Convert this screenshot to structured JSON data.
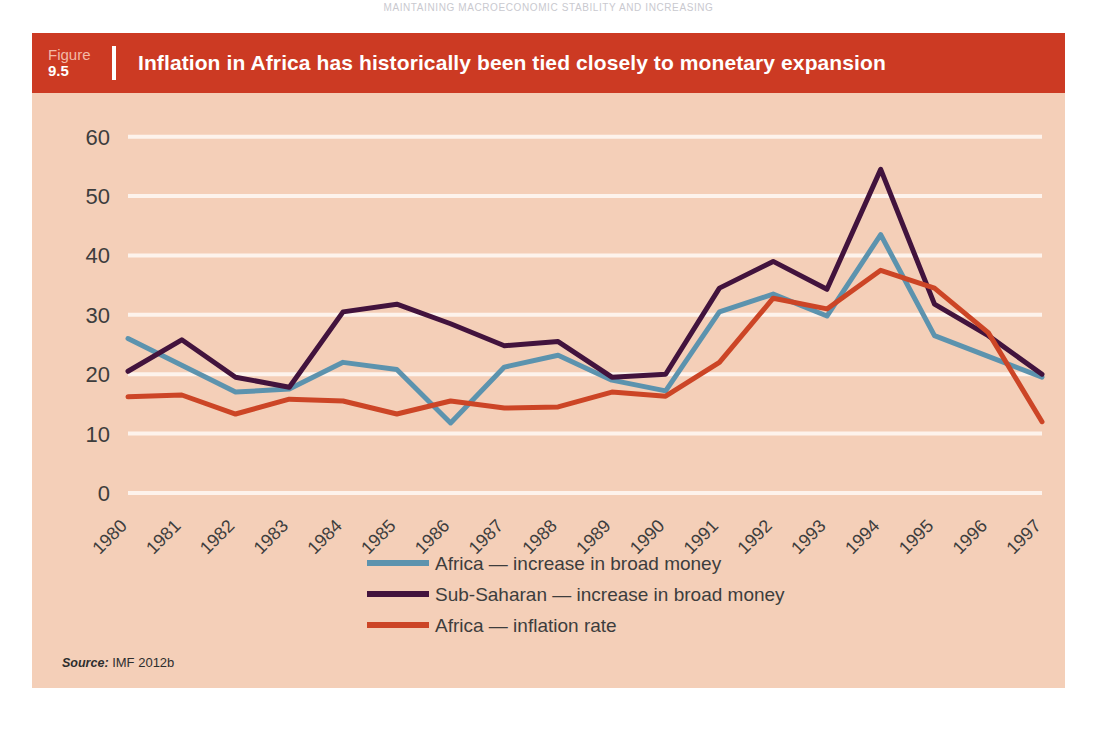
{
  "page_header": "MAINTAINING MACROECONOMIC STABILITY AND INCREASING",
  "figure": {
    "label": "Figure",
    "number": "9.5",
    "title": "Inflation in Africa has historically been tied closely to monetary expansion",
    "source_label": "Source:",
    "source_value": "IMF 2012b"
  },
  "colors": {
    "header_bar": "#cc3a23",
    "panel_bg": "#f4cfb8",
    "gridline": "#fdf3ec",
    "series_blue": "#5c93ae",
    "series_purple": "#42133d",
    "series_red": "#cc4526",
    "tick_text": "#3d3d3d"
  },
  "chart_data": {
    "type": "line",
    "title": "Inflation in Africa has historically been tied closely to monetary expansion",
    "xlabel": "",
    "ylabel": "",
    "ylim": [
      0,
      65
    ],
    "yticks": [
      0,
      10,
      20,
      30,
      40,
      50,
      60
    ],
    "ytick_labels": [
      "0",
      "10",
      "20",
      "30",
      "40",
      "50",
      "60"
    ],
    "grid": true,
    "legend_position": "bottom",
    "categories": [
      "1980",
      "1981",
      "1982",
      "1983",
      "1984",
      "1985",
      "1986",
      "1987",
      "1988",
      "1989",
      "1990",
      "1991",
      "1992",
      "1993",
      "1994",
      "1995",
      "1996",
      "1997"
    ],
    "series": [
      {
        "name": "Africa — increase in broad money",
        "color": "#5c93ae",
        "values": [
          26.0,
          21.5,
          17.0,
          17.5,
          22.0,
          20.8,
          11.8,
          21.2,
          23.2,
          19.0,
          17.2,
          30.5,
          33.5,
          29.8,
          43.5,
          26.5,
          23.0,
          19.5
        ]
      },
      {
        "name": "Sub-Saharan — increase in broad money",
        "color": "#42133d",
        "values": [
          20.5,
          25.8,
          19.5,
          17.8,
          30.5,
          31.8,
          28.5,
          24.8,
          25.5,
          19.5,
          20.0,
          34.5,
          39.0,
          34.3,
          54.5,
          31.8,
          26.5,
          20.0
        ]
      },
      {
        "name": "Africa — inflation rate",
        "color": "#cc4526",
        "values": [
          16.2,
          16.5,
          13.3,
          15.8,
          15.5,
          13.3,
          15.5,
          14.3,
          14.5,
          17.0,
          16.3,
          22.0,
          32.8,
          31.0,
          37.5,
          34.5,
          27.0,
          12.0
        ]
      }
    ],
    "legend": [
      "Africa — increase in broad money",
      "Sub-Saharan — increase in broad money",
      "Africa — inflation rate"
    ]
  }
}
